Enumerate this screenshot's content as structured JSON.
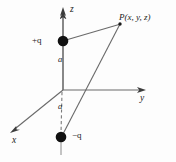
{
  "figure": {
    "type": "physics-diagram",
    "width": 176,
    "height": 162,
    "background_color": "#fdfdfd",
    "line_color": "#4a4a4a",
    "charge_color": "#111111",
    "text_color": "#1b1b1b"
  },
  "axes": {
    "z": {
      "label": "z",
      "direction": "up",
      "origin": [
        63,
        90
      ],
      "tip": [
        63,
        8
      ]
    },
    "y": {
      "label": "y",
      "direction": "right",
      "origin": [
        63,
        90
      ],
      "tip": [
        145,
        90
      ]
    },
    "x": {
      "label": "x",
      "direction": "down-left",
      "origin": [
        63,
        90
      ],
      "tip": [
        11,
        132
      ]
    }
  },
  "charges": [
    {
      "label": "+q",
      "sign": "positive",
      "position": [
        63,
        41
      ],
      "radius": 5.2,
      "label_offset": "left"
    },
    {
      "label": "−q",
      "sign": "negative",
      "position": [
        61,
        137
      ],
      "radius": 5.2,
      "label_offset": "right"
    }
  ],
  "distances": [
    {
      "label": "a",
      "from": "origin",
      "to": "+q",
      "label_position": [
        58,
        55
      ],
      "style": "solid"
    },
    {
      "label": "a",
      "from": "origin",
      "to": "−q",
      "label_position": [
        58,
        102
      ],
      "style": "dashed"
    }
  ],
  "field_point": {
    "label": "P(x, y, z)",
    "position": [
      120,
      24
    ],
    "dot_radius": 1.6,
    "label_position": [
      119,
      13
    ]
  },
  "rays": [
    {
      "name": "ray-from-positive-charge",
      "from": [
        63,
        41
      ],
      "to": [
        120,
        24
      ]
    },
    {
      "name": "ray-from-negative-charge",
      "from": [
        61,
        137
      ],
      "to": [
        120,
        24
      ]
    }
  ]
}
